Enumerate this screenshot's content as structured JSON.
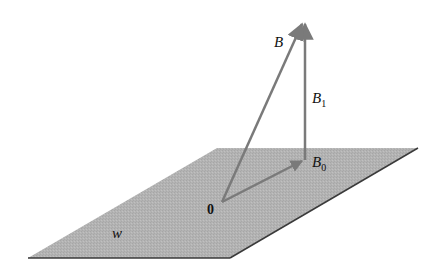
{
  "figure": {
    "colors": {
      "plane_fill": "#b3b3b3",
      "plane_edge": "#3a3a3a",
      "vector": "#7a7a7a",
      "text": "#111111",
      "background": "#ffffff"
    },
    "plane": {
      "label": "W",
      "corners": [
        [
          217,
          148
        ],
        [
          418,
          148
        ],
        [
          230,
          258
        ],
        [
          28,
          258
        ]
      ]
    },
    "origin": {
      "label": "0",
      "point": [
        222,
        202
      ]
    },
    "vectors": [
      {
        "name": "B",
        "label": "B",
        "subscript": "",
        "from": [
          222,
          202
        ],
        "to": [
          303,
          20
        ]
      },
      {
        "name": "B0",
        "label": "B",
        "subscript": "0",
        "from": [
          222,
          202
        ],
        "to": [
          304,
          160
        ]
      },
      {
        "name": "B1",
        "label": "B",
        "subscript": "1",
        "from": [
          305,
          160
        ],
        "to": [
          305,
          22
        ]
      }
    ]
  }
}
